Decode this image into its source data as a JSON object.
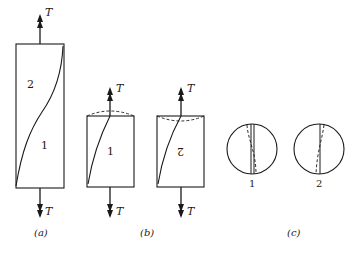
{
  "figure": {
    "panels": [
      {
        "id": "a",
        "caption": "(a)",
        "force_label_top": "T",
        "force_label_bottom": "T",
        "region_labels": [
          "2",
          "1"
        ]
      },
      {
        "id": "b",
        "caption": "(b)",
        "pieces": [
          {
            "label": "1",
            "force_label_top": "T",
            "force_label_bottom": "T",
            "end_surface": "bulge-up"
          },
          {
            "label": "2",
            "force_label_top": "T",
            "force_label_bottom": "T",
            "end_surface": "bulge-down",
            "label_inverted": true
          }
        ]
      },
      {
        "id": "c",
        "caption": "(c)",
        "cross_sections": [
          {
            "label": "1"
          },
          {
            "label": "2"
          }
        ]
      }
    ],
    "colors": {
      "stroke": "#1a1a1a",
      "background": "#ffffff"
    }
  }
}
